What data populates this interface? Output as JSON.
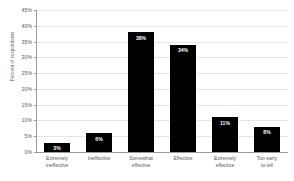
{
  "chart_data": {
    "type": "bar",
    "title": "",
    "subtitle": "",
    "xlabel": "",
    "ylabel": "Percent of respondents",
    "categories": [
      "Extremely\nineffective",
      "Ineffective",
      "Somewhat\neffective",
      "Effective",
      "Extremely\neffective",
      "Too early\nto tell"
    ],
    "values": [
      3,
      6,
      38,
      34,
      11,
      8
    ],
    "data_labels": [
      "3%",
      "6%",
      "38%",
      "34%",
      "11%",
      "8%"
    ],
    "ylim": [
      0,
      45
    ],
    "ytick_values": [
      0,
      5,
      10,
      15,
      20,
      25,
      30,
      35,
      40,
      45
    ],
    "ytick_labels": [
      "0%",
      "5%",
      "10%",
      "15%",
      "20%",
      "25%",
      "30%",
      "35%",
      "40%",
      "45%"
    ],
    "grid": true,
    "legend": false,
    "bar_color": "#000000",
    "label_color": "#ffffff",
    "axis_color": "#9b9b9b",
    "grid_color": "#e6e6e6",
    "text_color": "#58595b",
    "background": "#ffffff"
  }
}
